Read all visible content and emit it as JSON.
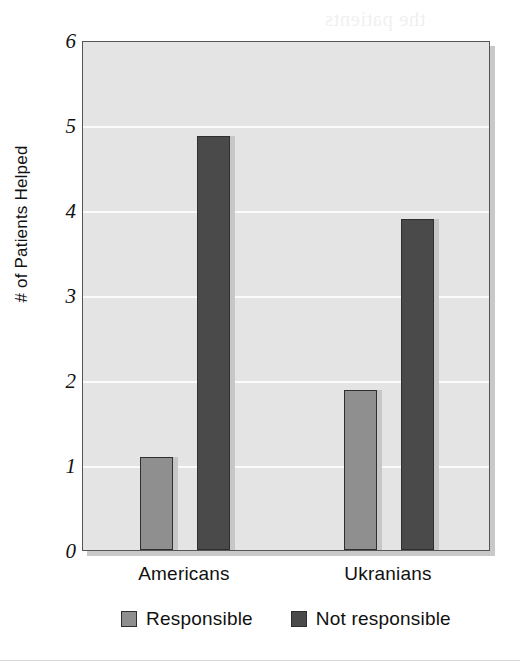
{
  "chart_data": {
    "type": "bar",
    "title": "",
    "xlabel": "",
    "ylabel": "# of Patients Helped",
    "categories": [
      "Americans",
      "Ukranians"
    ],
    "series": [
      {
        "name": "Responsible",
        "values": [
          1.1,
          1.88
        ],
        "color": "#8f8f8f"
      },
      {
        "name": "Not responsible",
        "values": [
          4.87,
          3.9
        ],
        "color": "#4a4a4a"
      }
    ],
    "ylim": [
      0,
      6
    ],
    "yticks": [
      0,
      1,
      2,
      3,
      4,
      5,
      6
    ],
    "ytick_labels": [
      "0",
      "1",
      "2",
      "3",
      "4",
      "5",
      "6"
    ],
    "grid": "horizontal-white-gridlines",
    "legend_position": "bottom-center",
    "plot_background": "#e4e4e4",
    "gridline_color": "#fbfbfb",
    "border_color": "#555555"
  },
  "axis": {
    "y_title": "# of Patients Helped",
    "y_tick_labels": [
      "6",
      "5",
      "4",
      "3",
      "2",
      "1",
      "0"
    ],
    "x_tick_labels": [
      "Americans",
      "Ukranians"
    ]
  },
  "legend": {
    "items": [
      {
        "label": "Responsible",
        "color": "#8f8f8f"
      },
      {
        "label": "Not responsible",
        "color": "#4a4a4a"
      }
    ]
  },
  "artifacts": {
    "bleed_text": "scanned facing page bleed-through",
    "bleed_top_text": ""
  }
}
